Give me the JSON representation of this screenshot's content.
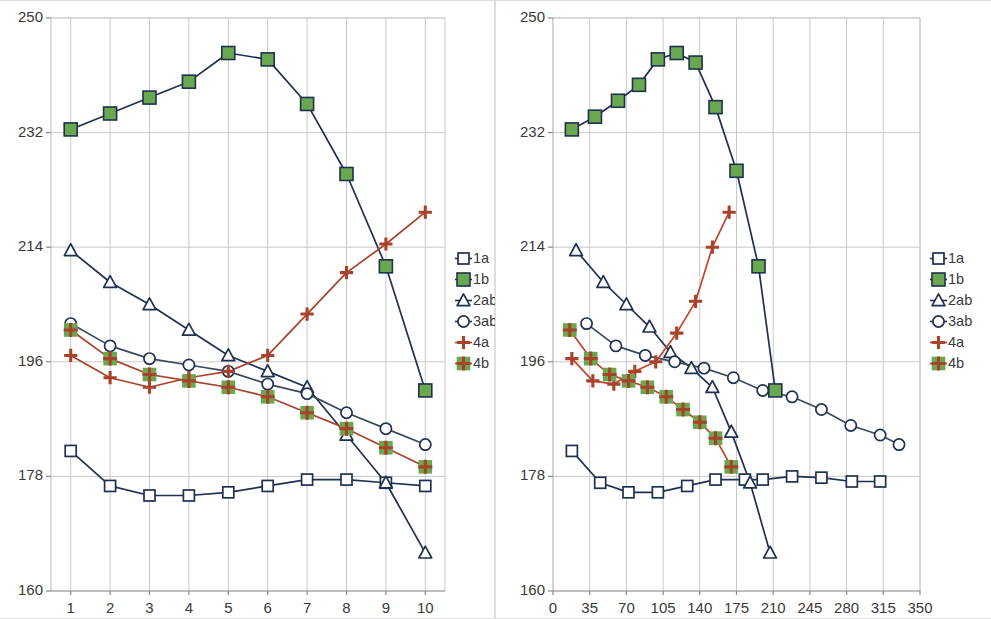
{
  "chart_data": [
    {
      "type": "line",
      "panel": "left",
      "title": "",
      "xlabel": "",
      "ylabel": "",
      "xlim": [
        0.5,
        10.5
      ],
      "ylim": [
        160,
        250
      ],
      "xticks": [
        "1",
        "2",
        "3",
        "4",
        "5",
        "6",
        "7",
        "8",
        "9",
        "10"
      ],
      "xtick_values": [
        1,
        2,
        3,
        4,
        5,
        6,
        7,
        8,
        9,
        10
      ],
      "yticks": [
        "160",
        "178",
        "196",
        "214",
        "232",
        "250"
      ],
      "ytick_values": [
        160,
        178,
        196,
        214,
        232,
        250
      ],
      "grid": true,
      "legend_position": "right",
      "x": [
        1,
        2,
        3,
        4,
        5,
        6,
        7,
        8,
        9,
        10
      ],
      "series": [
        {
          "name": "1a",
          "marker": "open-square",
          "line_color": "#1f3050",
          "marker_fill": "#ffffff",
          "marker_edge": "#1f3050",
          "values": [
            182.0,
            176.5,
            175.0,
            175.0,
            175.5,
            176.5,
            177.5,
            177.5,
            177.0,
            176.5
          ]
        },
        {
          "name": "1b",
          "marker": "filled-square",
          "line_color": "#1f3050",
          "marker_fill": "#6aa84f",
          "marker_edge": "#1f3050",
          "values": [
            232.5,
            235.0,
            237.5,
            240.0,
            244.5,
            243.5,
            236.5,
            225.5,
            211.0,
            191.5
          ]
        },
        {
          "name": "2ab",
          "marker": "open-triangle",
          "line_color": "#1f3050",
          "marker_fill": "#ffffff",
          "marker_edge": "#1f3050",
          "values": [
            213.5,
            208.5,
            205.0,
            201.0,
            197.0,
            194.5,
            192.0,
            184.5,
            177.0,
            166.0
          ]
        },
        {
          "name": "3ab",
          "marker": "open-circle",
          "line_color": "#3a4a5a",
          "marker_fill": "#ffffff",
          "marker_edge": "#1f3050",
          "values": [
            202.0,
            198.5,
            196.5,
            195.5,
            194.5,
            192.5,
            191.0,
            188.0,
            185.5,
            183.0
          ]
        },
        {
          "name": "4a",
          "marker": "plus",
          "line_color": "#a8422a",
          "marker_fill": "#a8422a",
          "marker_edge": "#a8422a",
          "values": [
            197.0,
            193.5,
            192.0,
            193.5,
            194.5,
            197.0,
            203.5,
            210.0,
            214.5,
            219.5
          ]
        },
        {
          "name": "4b",
          "marker": "plus-on-green-square",
          "line_color": "#a8422a",
          "marker_fill": "#6aa84f",
          "marker_edge": "#a8422a",
          "values": [
            201.0,
            196.5,
            194.0,
            193.0,
            192.0,
            190.5,
            188.0,
            185.5,
            182.5,
            179.5
          ]
        }
      ]
    },
    {
      "type": "line",
      "panel": "right",
      "title": "",
      "xlabel": "",
      "ylabel": "",
      "xlim": [
        0,
        350
      ],
      "ylim": [
        160,
        250
      ],
      "xticks": [
        "0",
        "35",
        "70",
        "105",
        "140",
        "175",
        "210",
        "245",
        "280",
        "315",
        "350"
      ],
      "xtick_values": [
        0,
        35,
        70,
        105,
        140,
        175,
        210,
        245,
        280,
        315,
        350
      ],
      "yticks": [
        "160",
        "178",
        "196",
        "214",
        "232",
        "250"
      ],
      "ytick_values": [
        160,
        178,
        196,
        214,
        232,
        250
      ],
      "grid": true,
      "legend_position": "right",
      "series": [
        {
          "name": "1a",
          "marker": "open-square",
          "line_color": "#1f3050",
          "marker_fill": "#ffffff",
          "marker_edge": "#1f3050",
          "x": [
            18,
            45,
            72,
            100,
            128,
            155,
            183,
            200,
            228,
            256,
            285,
            312
          ],
          "values": [
            182.0,
            177.0,
            175.5,
            175.5,
            176.5,
            177.5,
            177.5,
            177.5,
            178.0,
            177.8,
            177.2,
            177.2
          ]
        },
        {
          "name": "1b",
          "marker": "filled-square",
          "line_color": "#1f3050",
          "marker_fill": "#6aa84f",
          "marker_edge": "#1f3050",
          "x": [
            18,
            40,
            62,
            82,
            100,
            118,
            136,
            155,
            175,
            196,
            212
          ],
          "values": [
            232.5,
            234.5,
            237.0,
            239.5,
            243.5,
            244.5,
            243.0,
            236.0,
            226.0,
            211.0,
            191.5
          ]
        },
        {
          "name": "2ab",
          "marker": "open-triangle",
          "line_color": "#1f3050",
          "marker_fill": "#ffffff",
          "marker_edge": "#1f3050",
          "x": [
            22,
            48,
            70,
            92,
            112,
            132,
            152,
            170,
            188,
            207
          ],
          "values": [
            213.5,
            208.5,
            205.0,
            201.5,
            197.5,
            195.0,
            192.0,
            185.0,
            177.0,
            166.0
          ]
        },
        {
          "name": "3ab",
          "marker": "open-circle",
          "line_color": "#3a4a5a",
          "marker_fill": "#ffffff",
          "marker_edge": "#1f3050",
          "x": [
            32,
            60,
            88,
            116,
            144,
            172,
            200,
            228,
            256,
            284,
            312,
            330
          ],
          "values": [
            202.0,
            198.5,
            197.0,
            196.0,
            195.0,
            193.5,
            191.5,
            190.5,
            188.5,
            186.0,
            184.5,
            183.0
          ]
        },
        {
          "name": "4a",
          "marker": "plus",
          "line_color": "#c0442a",
          "marker_fill": "#a8422a",
          "marker_edge": "#a8422a",
          "x": [
            18,
            38,
            58,
            78,
            98,
            118,
            136,
            152,
            168
          ],
          "values": [
            196.5,
            193.0,
            192.5,
            194.5,
            196.0,
            200.5,
            205.5,
            214.0,
            219.5
          ]
        },
        {
          "name": "4b",
          "marker": "plus-on-green-square",
          "line_color": "#c0442a",
          "marker_fill": "#6aa84f",
          "marker_edge": "#a8422a",
          "x": [
            16,
            36,
            54,
            72,
            90,
            108,
            124,
            140,
            155,
            170
          ],
          "values": [
            201.0,
            196.5,
            194.0,
            193.0,
            192.0,
            190.5,
            188.5,
            186.5,
            184.0,
            179.5
          ]
        }
      ]
    }
  ],
  "legend": {
    "entries": [
      {
        "label": "1a",
        "marker": "open-square"
      },
      {
        "label": "1b",
        "marker": "filled-square"
      },
      {
        "label": "2ab",
        "marker": "open-triangle"
      },
      {
        "label": "3ab",
        "marker": "open-circle"
      },
      {
        "label": "4a",
        "marker": "plus"
      },
      {
        "label": "4b",
        "marker": "plus-on-green-square"
      }
    ]
  },
  "colors": {
    "navy": "#1f3050",
    "green": "#6aa84f",
    "rust": "#a8422a",
    "grid": "#c9c9c9",
    "axis_text": "#3a3a3a",
    "panel_border": "#dedede",
    "background": "#ffffff"
  }
}
